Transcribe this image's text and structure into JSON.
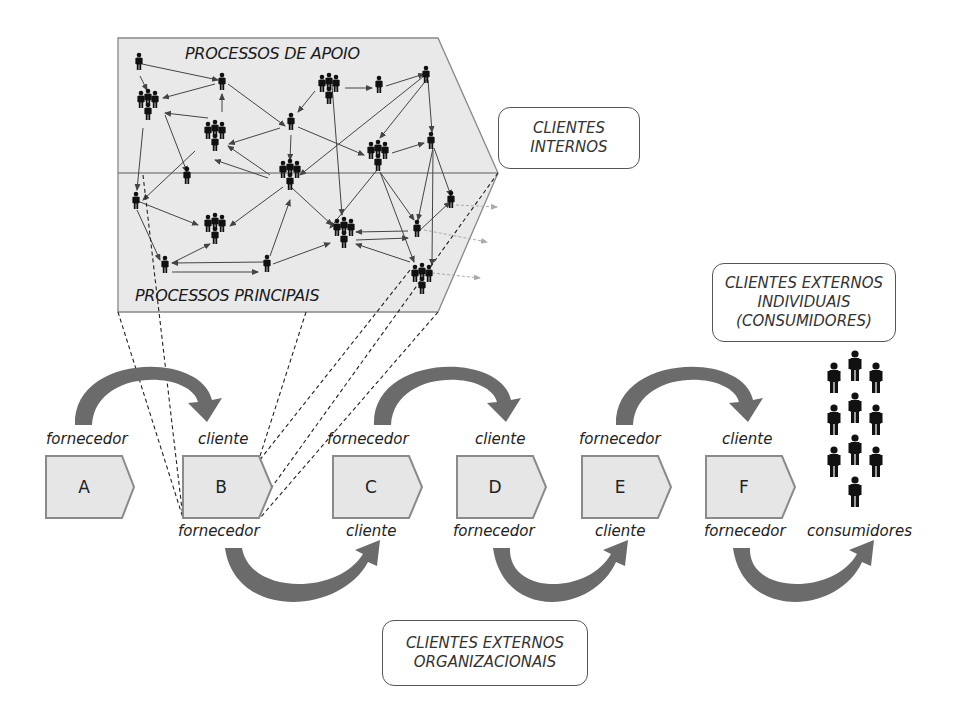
{
  "process_map": {
    "top_label": "PROCESSOS DE APOIO",
    "bottom_label": "PROCESSOS PRINCIPAIS"
  },
  "callouts": {
    "internal": [
      "CLIENTES",
      "INTERNOS"
    ],
    "external_individual": [
      "CLIENTES EXTERNOS",
      "INDIVIDUAIS",
      "(CONSUMIDORES)"
    ],
    "external_organizational": [
      "CLIENTES EXTERNOS",
      "ORGANIZACIONAIS"
    ]
  },
  "chain": [
    {
      "id": "A",
      "top": "fornecedor",
      "bottom": ""
    },
    {
      "id": "B",
      "top": "cliente",
      "bottom": "fornecedor"
    },
    {
      "id": "C",
      "top": "fornecedor",
      "bottom": "cliente"
    },
    {
      "id": "D",
      "top": "cliente",
      "bottom": "fornecedor"
    },
    {
      "id": "E",
      "top": "fornecedor",
      "bottom": "cliente"
    },
    {
      "id": "F",
      "top": "cliente",
      "bottom": "fornecedor"
    }
  ],
  "consumers_label": "consumidores",
  "colors": {
    "box_fill": "#e6e6e6",
    "box_stroke": "#8a8a8a",
    "arrow": "#6b6b6b",
    "figure": "#111111",
    "map_fill": "#e9e9e9"
  }
}
